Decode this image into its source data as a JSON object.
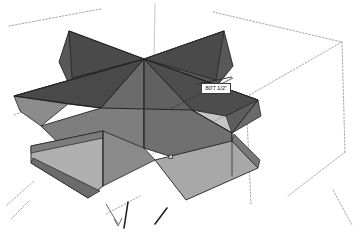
{
  "viewport": {
    "name": "3d-modeling-viewport",
    "background_color": "#ffffff",
    "width": 361,
    "height": 235
  },
  "model": {
    "shape_label": "star-extrusion-solid",
    "palette": {
      "face_dark": "#4b4b4b",
      "face_mid": "#6e6e6e",
      "face_medium": "#808080",
      "face_light": "#9a9a9a",
      "face_lightest": "#b4b4b4",
      "edge": "#232323",
      "guide_dashed": "#8c8c8c",
      "axis_faint": "#bdbdbd",
      "axis_dark": "#2a2a2a"
    }
  },
  "measure_readout": {
    "label": "Length",
    "value": "80'7 1/2\"",
    "text_color": "#1a1a1a",
    "border_color": "#3a3a3a",
    "background_color": "#ffffff"
  },
  "guides": {
    "bounding_box_label": "dashed-bounding-box",
    "inference_line_label": "inference-guide-line",
    "axis_label": "axis-stub"
  }
}
